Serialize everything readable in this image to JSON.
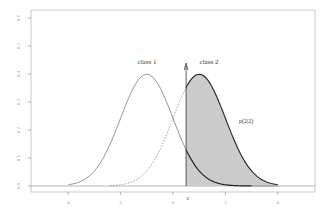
{
  "chart_data": {
    "type": "line",
    "title": "",
    "xlabel": "",
    "ylabel": "",
    "xlim": [
      -5.5,
      5.5
    ],
    "ylim": [
      0,
      0.6
    ],
    "x_ticks": [
      -4,
      -2,
      0,
      2,
      4
    ],
    "x_tick_labels": [
      "-4",
      "-2",
      "0",
      "2",
      "4"
    ],
    "y_ticks": [
      0.0,
      0.1,
      0.2,
      0.3,
      0.4,
      0.5,
      0.6
    ],
    "y_tick_labels": [
      "0.0",
      "0.1",
      "0.2",
      "0.3",
      "0.4",
      "0.5",
      "0.6"
    ],
    "grid": false,
    "threshold": {
      "label": "c",
      "x": 0.5
    },
    "series": [
      {
        "name": "class 1",
        "distribution": "normal",
        "mean": -1,
        "sd": 1,
        "peak": 0.4,
        "style": "solid",
        "label_x": -1,
        "label_y": 0.47
      },
      {
        "name": "class 2",
        "distribution": "normal",
        "mean": 1,
        "sd": 1,
        "peak": 0.4,
        "style": "dashed-left / bold-right",
        "label_x": 1.2,
        "label_y": 0.47
      }
    ],
    "shaded_region": {
      "series": "class 2",
      "from": 0.5,
      "to": 4,
      "label": "p(2|2)",
      "color": "#cccccc"
    },
    "annotations": [
      {
        "text": "class 1",
        "x": -1,
        "y": 0.47
      },
      {
        "text": "class 2",
        "x": 1.2,
        "y": 0.47
      },
      {
        "text": "p(2|2)",
        "x": 2.8,
        "y": 0.23
      },
      {
        "text": "c",
        "x": 0.5,
        "y": -0.05
      }
    ]
  },
  "colors": {
    "axis": "#888888",
    "curve": "#666666",
    "bold_curve": "#222222",
    "shade": "#cccccc",
    "text": "#333333"
  }
}
